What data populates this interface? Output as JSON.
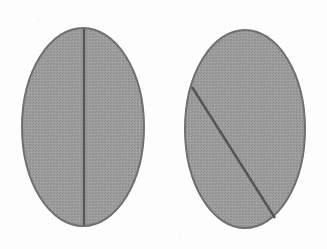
{
  "figure": {
    "kind": "geometric-diagram",
    "canvas": {
      "width": 327,
      "height": 249
    },
    "colors": {
      "background": "#fdfdfd",
      "ellipse_fill": "#9a9a9a",
      "ellipse_fill_light": "#a6a6a6",
      "ellipse_stroke": "#6f6f6f",
      "line_stroke": "#555555"
    },
    "shapes": [
      {
        "id": "ellipse-left",
        "name": "left-ellipse",
        "type": "ellipse",
        "cx": 83,
        "cy": 127,
        "rx": 61,
        "ry": 99,
        "fill": "#9a9a9a",
        "stroke": "#6f6f6f",
        "stroke_width": 2
      },
      {
        "id": "ellipse-right",
        "name": "right-ellipse",
        "type": "ellipse",
        "cx": 245,
        "cy": 129,
        "rx": 60,
        "ry": 99,
        "fill": "#9a9a9a",
        "stroke": "#6f6f6f",
        "stroke_width": 2
      }
    ],
    "lines": [
      {
        "id": "line-left",
        "name": "vertical-axis-line",
        "type": "line",
        "orientation": "vertical",
        "x1": 84,
        "y1": 29,
        "x2": 84,
        "y2": 225,
        "stroke": "#555555",
        "stroke_width": 2.4,
        "belongs_to": "ellipse-left",
        "role": "major-axis"
      },
      {
        "id": "line-right",
        "name": "diagonal-chord-line",
        "type": "line",
        "orientation": "diagonal",
        "x1": 192,
        "y1": 87,
        "x2": 275,
        "y2": 218,
        "stroke": "#555555",
        "stroke_width": 2.4,
        "belongs_to": "ellipse-right",
        "role": "chord"
      }
    ]
  }
}
